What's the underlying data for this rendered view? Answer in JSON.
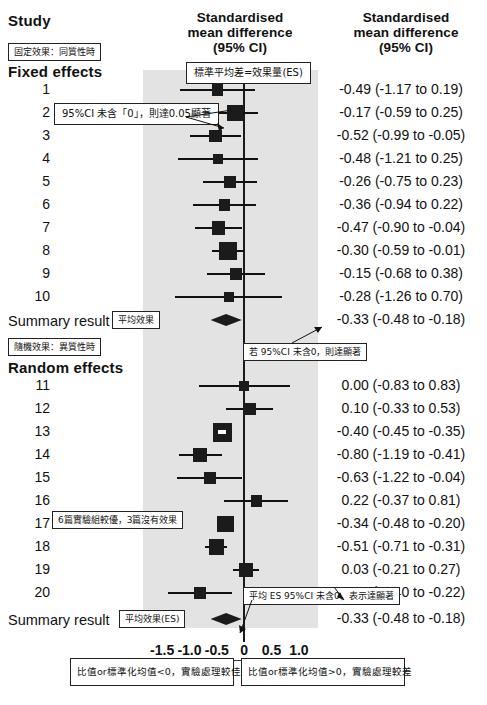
{
  "header": {
    "study_label": "Study",
    "middle_column": "Standardised mean difference (95% CI)",
    "middle_column_l1": "Standardised",
    "middle_column_l2": "mean difference",
    "middle_column_l3": "(95% CI)",
    "right_column_l1": "Standardised",
    "right_column_l2": "mean difference",
    "right_column_l3": "(95% CI)"
  },
  "sections": {
    "fixed_title": "Fixed effects",
    "random_title": "Random effects",
    "summary_label": "Summary result"
  },
  "annotations": {
    "fixed_effects_note": "固定效果：同質性時",
    "es_definition": "標準平均差=效果量(ES)",
    "ci_excludes_zero": "95%CI 未含「0」，則達0.05顯著",
    "mean_effect": "平均效果",
    "random_effects_note": "隨機效果：異質性時",
    "summary_ci_note": "若 95%CI 未含0，則達顯著",
    "study17_note": "6篇實驗組較優，3篇沒有效果",
    "mean_es_note": "平均 ES 95%CI 未含0，表示達顯著",
    "mean_effect_es": "平均效果(ES)",
    "footer_left": "比值or標準化均值<0，實驗處理較佳",
    "footer_right": "比值or標準化均值>0，實驗處理較差"
  },
  "chart_data": {
    "type": "forest",
    "title": "Standardised mean difference (95% CI)",
    "xlabel": "",
    "ylabel": "Study",
    "xlim": [
      -1.85,
      1.35
    ],
    "xticks": [
      -1.5,
      -1.0,
      -0.5,
      0,
      0.5,
      1.0
    ],
    "xticklabels": [
      "-1.5",
      "-1.0",
      "-0.5",
      "0",
      "0.5",
      "1.0"
    ],
    "reference_line": 0,
    "grid": false,
    "legend": "none",
    "groups": [
      {
        "name": "Fixed effects",
        "rows": [
          {
            "study": "1",
            "est": -0.49,
            "lo": -1.17,
            "hi": 0.19,
            "weight": 0.42,
            "text": "-0.49 (-1.17 to 0.19)"
          },
          {
            "study": "2",
            "est": -0.17,
            "lo": -0.59,
            "hi": 0.25,
            "weight": 0.74,
            "text": "-0.17 (-0.59 to 0.25)"
          },
          {
            "study": "3",
            "est": -0.52,
            "lo": -0.99,
            "hi": -0.05,
            "weight": 0.52,
            "text": "-0.52 (-0.99 to -0.05)"
          },
          {
            "study": "4",
            "est": -0.48,
            "lo": -1.21,
            "hi": 0.25,
            "weight": 0.3,
            "text": "-0.48 (-1.21 to 0.25)"
          },
          {
            "study": "5",
            "est": -0.26,
            "lo": -0.75,
            "hi": 0.23,
            "weight": 0.5,
            "text": "-0.26 (-0.75 to 0.23)"
          },
          {
            "study": "6",
            "est": -0.36,
            "lo": -0.94,
            "hi": 0.22,
            "weight": 0.4,
            "text": "-0.36 (-0.94 to 0.22)"
          },
          {
            "study": "7",
            "est": -0.47,
            "lo": -0.9,
            "hi": -0.04,
            "weight": 0.6,
            "text": "-0.47 (-0.90 to -0.04)"
          },
          {
            "study": "8",
            "est": -0.3,
            "lo": -0.59,
            "hi": -0.01,
            "weight": 0.95,
            "text": "-0.30 (-0.59 to -0.01)"
          },
          {
            "study": "9",
            "est": -0.15,
            "lo": -0.68,
            "hi": 0.38,
            "weight": 0.45,
            "text": "-0.15 (-0.68 to 0.38)"
          },
          {
            "study": "10",
            "est": -0.28,
            "lo": -1.26,
            "hi": 0.7,
            "weight": 0.26,
            "text": "-0.28 (-1.26 to 0.70)"
          }
        ],
        "summary": {
          "label": "Summary result",
          "est": -0.33,
          "lo": -0.48,
          "hi": -0.18,
          "text": "-0.33 (-0.48 to -0.18)"
        }
      },
      {
        "name": "Random effects",
        "rows": [
          {
            "study": "11",
            "est": 0.0,
            "lo": -0.83,
            "hi": 0.83,
            "weight": 0.26,
            "text": "0.00 (-0.83 to 0.83)"
          },
          {
            "study": "12",
            "est": 0.1,
            "lo": -0.33,
            "hi": 0.53,
            "weight": 0.5,
            "text": "0.10 (-0.33 to 0.53)"
          },
          {
            "study": "13",
            "est": -0.4,
            "lo": -0.45,
            "hi": -0.35,
            "weight": 1.0,
            "text": "-0.40 (-0.45 to -0.35)"
          },
          {
            "study": "14",
            "est": -0.8,
            "lo": -1.19,
            "hi": -0.41,
            "weight": 0.62,
            "text": "-0.80 (-1.19 to -0.41)"
          },
          {
            "study": "15",
            "est": -0.63,
            "lo": -1.22,
            "hi": -0.04,
            "weight": 0.45,
            "text": "-0.63 (-1.22 to -0.04)"
          },
          {
            "study": "16",
            "est": 0.22,
            "lo": -0.37,
            "hi": 0.81,
            "weight": 0.4,
            "text": "0.22 (-0.37 to 0.81)"
          },
          {
            "study": "17",
            "est": -0.34,
            "lo": -0.48,
            "hi": -0.2,
            "weight": 0.8,
            "text": "-0.34 (-0.48 to -0.20)"
          },
          {
            "study": "18",
            "est": -0.51,
            "lo": -0.71,
            "hi": -0.31,
            "weight": 0.7,
            "text": "-0.51 (-0.71 to -0.31)"
          },
          {
            "study": "19",
            "est": 0.03,
            "lo": -0.21,
            "hi": 0.27,
            "weight": 0.62,
            "text": "0.03 (-0.21 to 0.27)"
          },
          {
            "study": "20",
            "est": -0.81,
            "lo": -1.4,
            "hi": -0.22,
            "weight": 0.44,
            "text": "-0.81 (-1.40 to -0.22)"
          }
        ],
        "summary": {
          "label": "Summary result",
          "est": -0.33,
          "lo": -0.48,
          "hi": -0.18,
          "text": "-0.33 (-0.48 to -0.18)"
        }
      }
    ]
  }
}
